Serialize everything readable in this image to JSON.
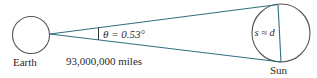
{
  "diagram": {
    "earth": {
      "label": "Earth"
    },
    "sun": {
      "label": "Sun",
      "chord_label": "s ≈ d"
    },
    "angle": {
      "label": "θ = 0.53°"
    },
    "distance": {
      "label": "93,000,000 miles"
    },
    "colors": {
      "circle": "#555555",
      "line": "#2f6f7f",
      "text": "#2b2b2b"
    }
  }
}
